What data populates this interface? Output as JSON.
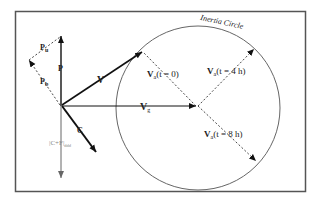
{
  "diagram": {
    "title": "Inertia Circle",
    "labels": {
      "inertia_circle": "Inertia Circle",
      "P": "P",
      "Pu": "P",
      "Pu_sub": "u",
      "Pb": "P",
      "Pb_sub": "b",
      "V": "V",
      "Vg": "V",
      "Vg_sub": "g",
      "C": "C",
      "CF": "|C+F|",
      "CF_sub": "ddd",
      "Va0_main": "V",
      "Va0_sub": "a",
      "Va0_rest": "(t = 0)",
      "Va4_main": "V",
      "Va4_sub": "a",
      "Va4_rest": "(t = 4 h)",
      "Va8_main": "V",
      "Va8_sub": "a",
      "Va8_rest": "(t = 8 h)"
    },
    "colors": {
      "frame": "#555555",
      "vector": "#111111",
      "circle": "#666666",
      "dashed": "#333333",
      "cf_vector": "#777777"
    }
  }
}
